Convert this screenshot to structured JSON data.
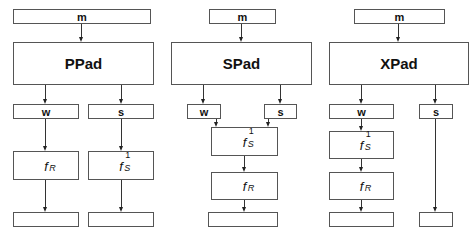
{
  "diagrams": [
    {
      "name": "PPad",
      "input": "m",
      "outputs": {
        "left": "w",
        "right": "s"
      },
      "left_chain": [
        {
          "base": "f",
          "sub": "R",
          "sup": ""
        }
      ],
      "right_chain": [
        {
          "base": "f",
          "sub": "S",
          "sup": "1"
        }
      ],
      "final": [
        "",
        ""
      ]
    },
    {
      "name": "SPad",
      "input": "m",
      "outputs": {
        "left": "w",
        "right": "s"
      },
      "merged_chain": [
        {
          "base": "f",
          "sub": "S",
          "sup": "1"
        },
        {
          "base": "f",
          "sub": "R",
          "sup": ""
        }
      ],
      "final": [
        ""
      ]
    },
    {
      "name": "XPad",
      "input": "m",
      "outputs": {
        "left": "w",
        "right": "s"
      },
      "left_chain": [
        {
          "base": "f",
          "sub": "S",
          "sup": "1"
        },
        {
          "base": "f",
          "sub": "R",
          "sup": ""
        }
      ],
      "right_chain": [],
      "final": [
        "",
        ""
      ]
    }
  ]
}
